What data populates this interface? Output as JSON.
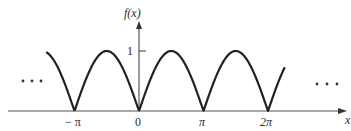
{
  "chart_data": {
    "type": "line",
    "title": "",
    "function": "f(x) = |sin x|",
    "xlabel": "x",
    "ylabel": "f(x)",
    "x_ticks": [
      "−π",
      "0",
      "π",
      "2π"
    ],
    "x_tick_values": [
      -3.14159,
      0,
      3.14159,
      6.28319
    ],
    "y_ticks": [
      "1"
    ],
    "y_tick_values": [
      1
    ],
    "xlim": [
      -4.5,
      7.1
    ],
    "ylim": [
      0,
      1.2
    ],
    "series": [
      {
        "name": "f(x)",
        "x": [
          -4.5,
          -3.927,
          -3.1416,
          -2.3562,
          -1.5708,
          -0.7854,
          0,
          0.7854,
          1.5708,
          2.3562,
          3.1416,
          3.927,
          4.7124,
          5.4978,
          6.2832,
          7.0686
        ],
        "values": [
          0.98,
          0.707,
          0,
          0.707,
          1,
          0.707,
          0,
          0.707,
          1,
          0.707,
          0,
          0.707,
          1,
          0.707,
          0,
          0.707
        ]
      }
    ],
    "annotations": [
      "… (continues left)",
      "… (continues right)"
    ],
    "grid": false,
    "legend": null
  },
  "labels": {
    "y_axis": "f(x)",
    "x_axis": "x",
    "y_tick_1": "1",
    "x_tick_neg_pi": "− π",
    "x_tick_0": "0",
    "x_tick_pi": "π",
    "x_tick_2pi": "2π",
    "ellipsis_left": "• • •",
    "ellipsis_right": "• • •"
  },
  "colors": {
    "curve": "#222222",
    "axis": "#555555"
  }
}
